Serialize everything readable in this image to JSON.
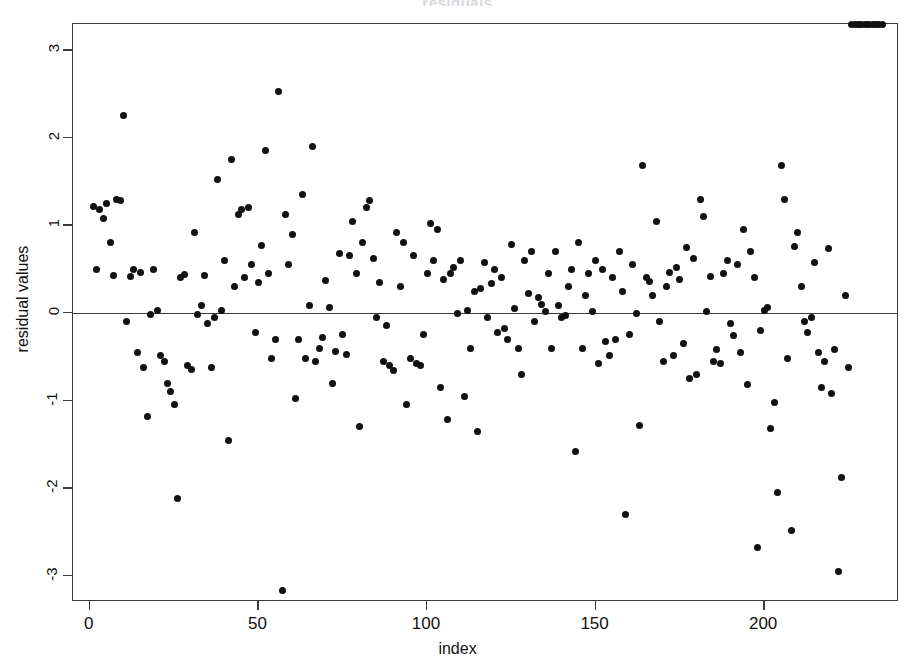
{
  "chart_data": {
    "type": "scatter",
    "title": "residuals",
    "xlabel": "index",
    "ylabel": "residual values",
    "xlim": [
      -5,
      240
    ],
    "ylim": [
      -3.3,
      3.3
    ],
    "xticks": [
      0,
      50,
      100,
      150,
      200
    ],
    "xtick_labels": [
      "0",
      "50",
      "100",
      "150",
      "200"
    ],
    "yticks": [
      -3,
      -2,
      -1,
      0,
      1,
      2,
      3
    ],
    "ytick_labels": [
      "-3",
      "-2",
      "-1",
      "0",
      "1",
      "2",
      "3"
    ],
    "grid": false,
    "legend": null,
    "reference_line": {
      "orientation": "horizontal",
      "y": 0,
      "color": "#3a3a3a"
    },
    "marker": {
      "shape": "circle",
      "filled": true,
      "color": "#111111",
      "size": 7
    },
    "n_points": 235,
    "x": [
      1,
      2,
      3,
      4,
      5,
      6,
      7,
      8,
      9,
      10,
      11,
      12,
      13,
      14,
      15,
      16,
      17,
      18,
      19,
      20,
      21,
      22,
      23,
      24,
      25,
      26,
      27,
      28,
      29,
      30,
      31,
      32,
      33,
      34,
      35,
      36,
      37,
      38,
      39,
      40,
      41,
      42,
      43,
      44,
      45,
      46,
      47,
      48,
      49,
      50,
      51,
      52,
      53,
      54,
      55,
      56,
      57,
      58,
      59,
      60,
      61,
      62,
      63,
      64,
      65,
      66,
      67,
      68,
      69,
      70,
      71,
      72,
      73,
      74,
      75,
      76,
      77,
      78,
      79,
      80,
      81,
      82,
      83,
      84,
      85,
      86,
      87,
      88,
      89,
      90,
      91,
      92,
      93,
      94,
      95,
      96,
      97,
      98,
      99,
      100,
      101,
      102,
      103,
      104,
      105,
      106,
      107,
      108,
      109,
      110,
      111,
      112,
      113,
      114,
      115,
      116,
      117,
      118,
      119,
      120,
      121,
      122,
      123,
      124,
      125,
      126,
      127,
      128,
      129,
      130,
      131,
      132,
      133,
      134,
      135,
      136,
      137,
      138,
      139,
      140,
      141,
      142,
      143,
      144,
      145,
      146,
      147,
      148,
      149,
      150,
      151,
      152,
      153,
      154,
      155,
      156,
      157,
      158,
      159,
      160,
      161,
      162,
      163,
      164,
      165,
      166,
      167,
      168,
      169,
      170,
      171,
      172,
      173,
      174,
      175,
      176,
      177,
      178,
      179,
      180,
      181,
      182,
      183,
      184,
      185,
      186,
      187,
      188,
      189,
      190,
      191,
      192,
      193,
      194,
      195,
      196,
      197,
      198,
      199,
      200,
      201,
      202,
      203,
      204,
      205,
      206,
      207,
      208,
      209,
      210,
      211,
      212,
      213,
      214,
      215,
      216,
      217,
      218,
      219,
      220,
      221,
      222,
      223,
      224,
      225,
      226,
      227,
      228,
      229,
      230,
      231,
      232,
      233,
      234,
      235
    ],
    "y": [
      1.22,
      0.5,
      1.18,
      1.08,
      1.25,
      0.8,
      0.43,
      1.3,
      1.28,
      2.25,
      -0.1,
      0.42,
      0.5,
      -0.45,
      0.46,
      -0.62,
      -1.18,
      -0.02,
      0.5,
      0.03,
      -0.48,
      -0.55,
      -0.8,
      -0.9,
      -1.05,
      -2.12,
      0.4,
      0.44,
      -0.6,
      -0.65,
      0.92,
      -0.02,
      0.08,
      0.43,
      -0.12,
      -0.62,
      -0.05,
      1.52,
      0.03,
      0.6,
      -1.46,
      1.75,
      0.3,
      1.12,
      1.18,
      0.4,
      1.2,
      0.55,
      -0.22,
      0.35,
      0.77,
      1.85,
      0.45,
      -0.52,
      -0.3,
      2.53,
      -3.17,
      1.13,
      0.55,
      0.9,
      -0.98,
      -0.3,
      1.35,
      -0.52,
      0.08,
      1.9,
      -0.55,
      -0.4,
      -0.28,
      0.37,
      0.06,
      -0.8,
      -0.44,
      0.68,
      -0.25,
      -0.47,
      0.66,
      1.05,
      0.45,
      -1.3,
      0.8,
      1.2,
      1.28,
      0.62,
      -0.05,
      0.35,
      -0.55,
      -0.14,
      -0.6,
      -0.66,
      0.92,
      0.3,
      0.8,
      -1.05,
      -0.52,
      0.66,
      -0.58,
      -0.6,
      -0.25,
      0.45,
      1.02,
      0.6,
      0.95,
      -0.85,
      0.38,
      -1.22,
      0.45,
      0.52,
      0.0,
      0.6,
      -0.95,
      0.03,
      -0.4,
      0.25,
      -1.35,
      0.28,
      0.58,
      -0.05,
      0.34,
      0.5,
      -0.22,
      0.4,
      -0.18,
      -0.3,
      0.78,
      0.05,
      -0.4,
      -0.7,
      0.6,
      0.22,
      0.7,
      -0.1,
      0.18,
      0.1,
      0.02,
      0.45,
      -0.4,
      0.7,
      0.08,
      -0.05,
      -0.03,
      0.3,
      0.5,
      -1.58,
      0.8,
      -0.4,
      0.2,
      0.45,
      0.02,
      0.6,
      -0.58,
      0.5,
      -0.32,
      -0.48,
      0.4,
      -0.3,
      0.7,
      0.25,
      -2.3,
      -0.25,
      0.55,
      0.0,
      -1.28,
      1.68,
      0.4,
      0.36,
      0.2,
      1.05,
      -0.1,
      -0.55,
      0.3,
      0.46,
      -0.48,
      0.52,
      0.38,
      -0.35,
      0.75,
      -0.75,
      0.62,
      -0.7,
      1.3,
      1.1,
      0.02,
      0.42,
      -0.55,
      -0.42,
      -0.58,
      0.45,
      0.6,
      -0.12,
      -0.26,
      0.55,
      -0.45,
      0.95,
      -0.82,
      0.7,
      0.4,
      -2.68,
      -0.2,
      0.03,
      0.06,
      -1.32,
      -1.02,
      -2.05,
      1.68,
      1.3,
      -0.52,
      -2.48,
      0.76,
      0.92,
      0.3,
      -0.1,
      -0.22,
      -0.05,
      0.58,
      -0.45,
      -0.85,
      -0.55,
      0.74,
      -0.92,
      -0.42,
      -2.95,
      -1.88,
      0.2,
      -0.62
    ]
  }
}
